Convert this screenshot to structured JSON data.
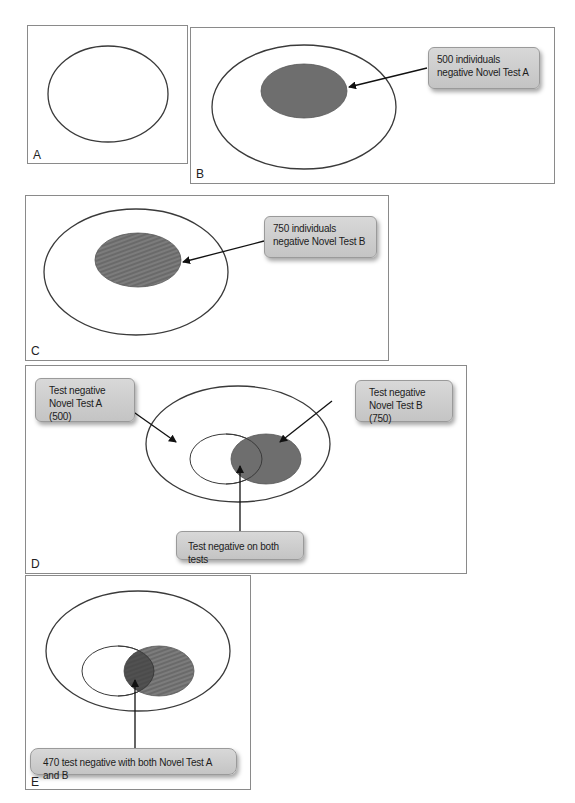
{
  "panels": {
    "A": {
      "letter": "A"
    },
    "B": {
      "letter": "B",
      "callout": "500 individuals negative Novel Test A"
    },
    "C": {
      "letter": "C",
      "callout": "750 individuals negative Novel Test B"
    },
    "D": {
      "letter": "D",
      "callout_left": "Test negative Novel Test A (500)",
      "callout_right": "Test negative Novel Test B (750)",
      "callout_bottom": "Test negative on both tests"
    },
    "E": {
      "letter": "E",
      "callout": "470 test negative with both Novel Test A and B"
    }
  },
  "colors": {
    "fill_dark": "#6e6e6e",
    "fill_striped": "#7a7a7a",
    "overlap": "#4a4a4a",
    "outline": "#3a3a3a",
    "panel_border": "#8a8a8a"
  }
}
